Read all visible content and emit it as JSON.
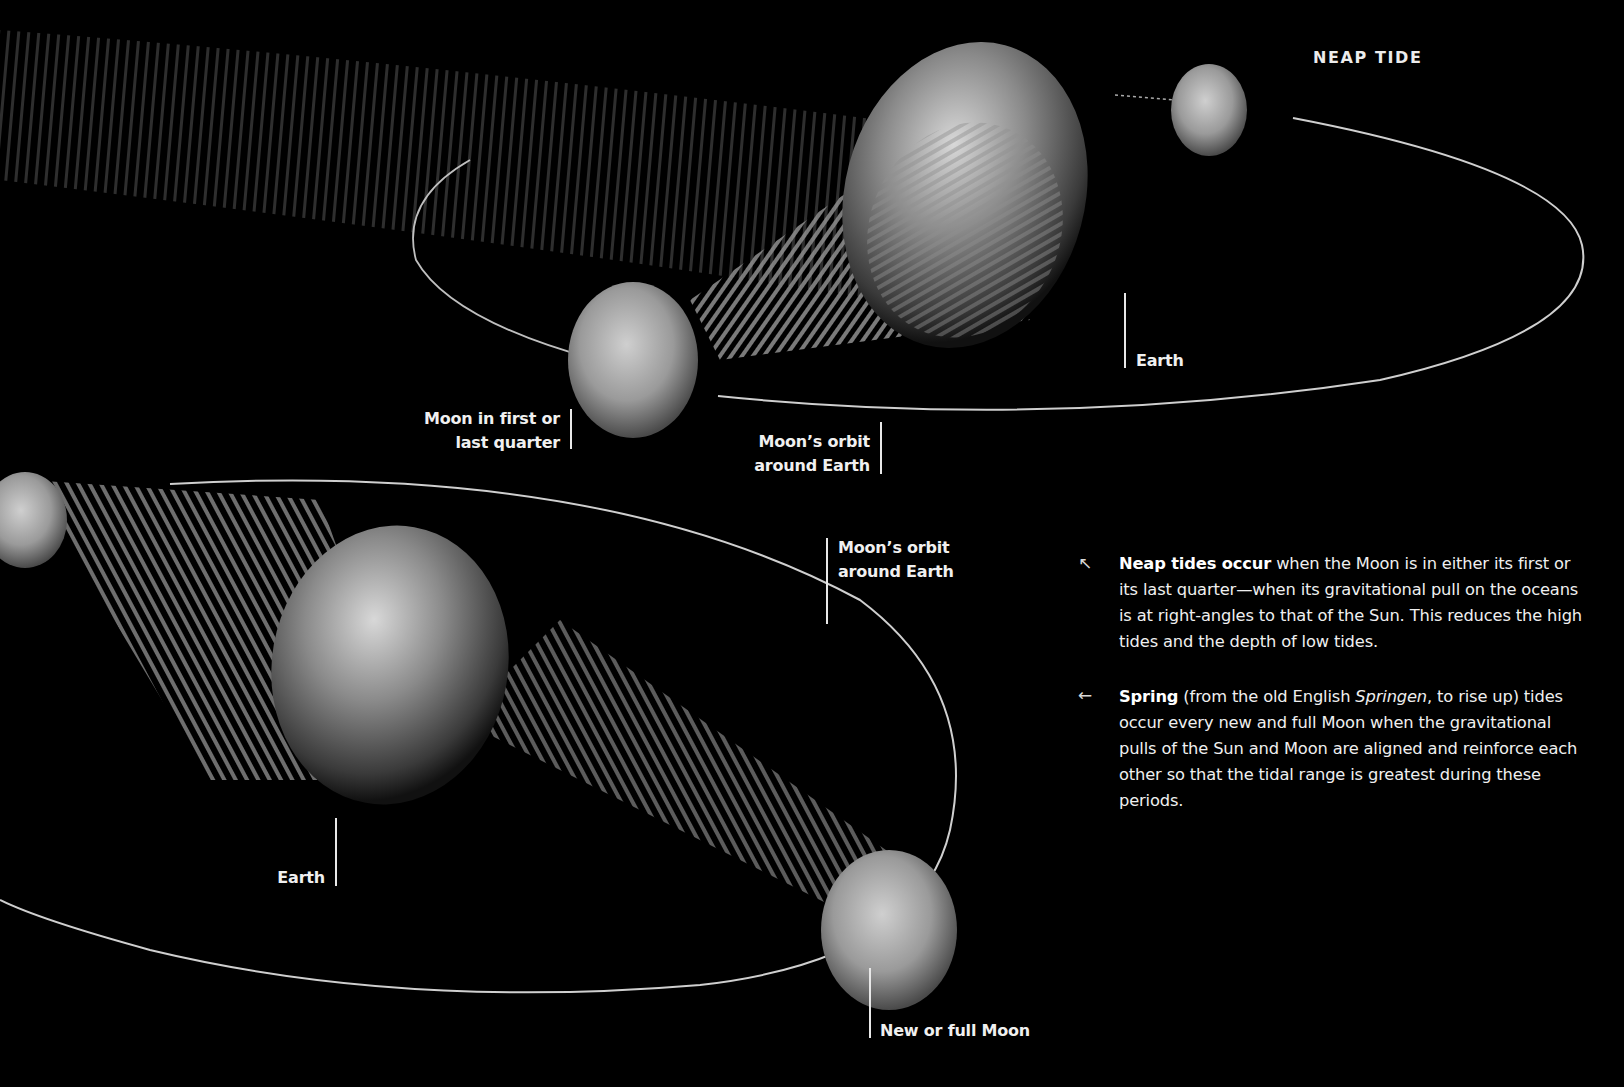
{
  "title": "NEAP TIDE",
  "labels": {
    "earth_top": "Earth",
    "moon_quarter_line1": "Moon in first or",
    "moon_quarter_line2": "last quarter",
    "orbit_top_line1": "Moon’s orbit",
    "orbit_top_line2": "around Earth",
    "orbit_bottom_line1": "Moon’s orbit",
    "orbit_bottom_line2": "around Earth",
    "earth_bottom": "Earth",
    "new_full_moon": "New or full Moon"
  },
  "paragraphs": {
    "neap": {
      "arrow_icon": "↖",
      "bold": "Neap tides occur",
      "text": " when the Moon is in either its first or its last quarter—when its gravitational pull on the oceans is at right-angles to that of the Sun. This reduces the high tides and the depth of low tides."
    },
    "spring": {
      "arrow_icon": "←",
      "bold": "Spring",
      "text_before_italic": " (from the old English ",
      "italic": "Springen",
      "text_after_italic": ", to rise up) tides occur every new and full Moon when the gravitational pulls of the Sun and Moon are aligned and reinforce each other so that the tidal range is greatest during these periods."
    }
  },
  "colors": {
    "background": "#000000",
    "text": "#f0f0f0",
    "orbit_line": "#cfcfcf"
  }
}
